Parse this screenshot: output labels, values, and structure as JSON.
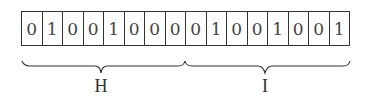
{
  "diagram": {
    "bits": [
      "0",
      "1",
      "0",
      "0",
      "1",
      "0",
      "0",
      "0",
      "0",
      "1",
      "0",
      "0",
      "1",
      "0",
      "0",
      "1"
    ],
    "groups": [
      {
        "label": "H",
        "bits": "01001000",
        "start": 0,
        "end": 8
      },
      {
        "label": "I",
        "bits": "01001001",
        "start": 8,
        "end": 16
      }
    ],
    "colors": {
      "line": "#333333",
      "text": "#444444",
      "background": "#ffffff"
    }
  }
}
